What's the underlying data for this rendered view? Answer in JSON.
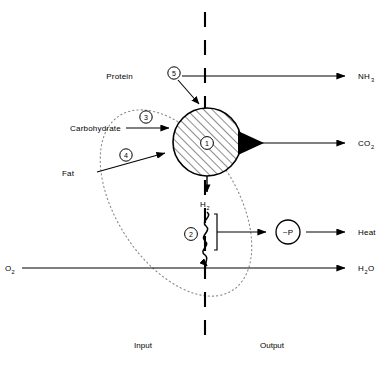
{
  "diagram": {
    "colors": {
      "stroke": "#000000",
      "background": "#ffffff",
      "dotted": "#777777"
    },
    "divider": {
      "name": "membrane-boundary",
      "style": "dashed-vertical"
    },
    "footer": {
      "input_label": "Input",
      "output_label": "Output"
    },
    "inputs": [
      {
        "id": "protein",
        "label": "Protein",
        "marker": "5"
      },
      {
        "id": "carbohydrate",
        "label": "Carbohydrate",
        "marker": "3"
      },
      {
        "id": "fat",
        "label": "Fat",
        "marker": "4"
      },
      {
        "id": "oxygen",
        "label": "O",
        "sub": "2"
      }
    ],
    "outputs": [
      {
        "id": "ammonia",
        "label": "NH",
        "sub": "3"
      },
      {
        "id": "carbon-dioxide",
        "label": "CO",
        "sub": "2"
      },
      {
        "id": "heat",
        "label": "Heat",
        "sub": ""
      },
      {
        "id": "water",
        "label": "H",
        "sub": "2",
        "post": "O"
      }
    ],
    "nodes": [
      {
        "id": "tricarboxylic-cycle",
        "marker": "1",
        "style": "hatched-circle"
      },
      {
        "id": "hydrogen-transport",
        "marker": "2",
        "style": "wavy-bracket"
      },
      {
        "id": "high-energy-phosphate",
        "label": "~P",
        "style": "circle"
      }
    ],
    "intermediate": {
      "id": "hydrogen",
      "label": "H",
      "sub": "2"
    },
    "markers": {
      "one": "1",
      "two": "2",
      "three": "3",
      "four": "4",
      "five": "5"
    },
    "phosphate_label": "~P"
  }
}
